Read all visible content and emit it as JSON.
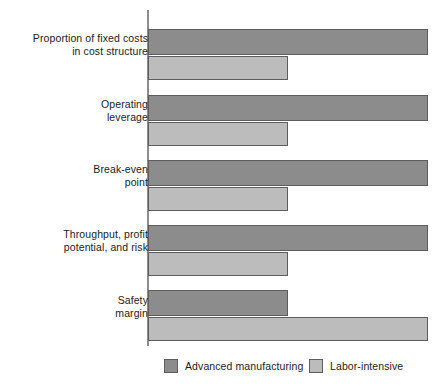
{
  "chart_data": {
    "type": "bar",
    "orientation": "horizontal",
    "title": "",
    "subtitle": "",
    "xlabel": "",
    "ylabel": "",
    "grid": false,
    "xlim": [
      0,
      100
    ],
    "axis_ticks": [],
    "legend_position": "bottom",
    "categories": [
      "Proportion of fixed costs in cost structure",
      "Operating leverage",
      "Break-even point",
      "Throughput, profit potential, and risk",
      "Safety margin"
    ],
    "series": [
      {
        "name": "Advanced manufacturing",
        "color": "#8c8c8c",
        "values": [
          96,
          96,
          96,
          96,
          48
        ]
      },
      {
        "name": "Labor-intensive",
        "color": "#bcbcbc",
        "values": [
          48,
          48,
          48,
          48,
          96
        ]
      }
    ]
  },
  "axis": {
    "label_rows": [
      {
        "line1": "Proportion of fixed costs",
        "line2": "in cost structure"
      },
      {
        "line1": "Operating",
        "line2": "leverage"
      },
      {
        "line1": "Break-even",
        "line2": "point"
      },
      {
        "line1": "Throughput, profit",
        "line2": "potential, and risk"
      },
      {
        "line1": "Safety",
        "line2": "margin"
      }
    ]
  },
  "legend": {
    "items": [
      {
        "label": "Advanced manufacturing",
        "color": "#8c8c8c"
      },
      {
        "label": "Labor-intensive",
        "color": "#bcbcbc"
      }
    ]
  },
  "colors": {
    "advanced_manufacturing": "#8c8c8c",
    "labor_intensive": "#bcbcbc",
    "bar_border": "#5d5d5d",
    "axis_line": "#8d8d8d",
    "text": "#1c1c1c",
    "background": "#ffffff"
  }
}
